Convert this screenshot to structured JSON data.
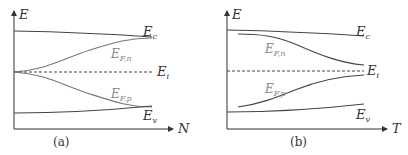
{
  "panels": [
    {
      "id": "a",
      "caption": "(a)",
      "y_axis_label": "E",
      "x_axis_label": "N",
      "curves": {
        "Ec": {
          "label": "E",
          "sub": "c"
        },
        "EFn": {
          "label": "E",
          "sub": "F,n"
        },
        "Ei": {
          "label": "E",
          "sub": "i"
        },
        "EFp": {
          "label": "E",
          "sub": "F,p"
        },
        "Ev": {
          "label": "E",
          "sub": "v"
        }
      }
    },
    {
      "id": "b",
      "caption": "(b)",
      "y_axis_label": "E",
      "x_axis_label": "T",
      "curves": {
        "Ec": {
          "label": "E",
          "sub": "c"
        },
        "EFn": {
          "label": "E",
          "sub": "F,n"
        },
        "Ei": {
          "label": "E",
          "sub": "i"
        },
        "EFp": {
          "label": "E",
          "sub": "F,p"
        },
        "Ev": {
          "label": "E",
          "sub": "v"
        }
      }
    }
  ]
}
